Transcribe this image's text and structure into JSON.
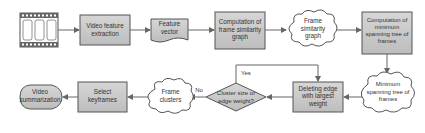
{
  "diagram": {
    "type": "flowchart",
    "colors": {
      "box_fill": "#c9c9c9",
      "box_stroke": "#555555",
      "line": "#666666",
      "cloud_fill": "#ffffff",
      "text": "#333333"
    },
    "nodes": {
      "video_input": {
        "shape": "film-strip",
        "label": ""
      },
      "feature_extraction": {
        "shape": "process",
        "line1": "Video feature",
        "line2": "extraction"
      },
      "feature_vector": {
        "shape": "document",
        "line1": "Feature",
        "line2": "vector"
      },
      "similarity_graph_comp": {
        "shape": "process",
        "line1": "Computation of",
        "line2": "frame similarity",
        "line3": "graph"
      },
      "similarity_graph": {
        "shape": "cloud",
        "line1": "Frame",
        "line2": "similarity",
        "line3": "graph"
      },
      "mst_comp": {
        "shape": "process",
        "line1": "Computation of",
        "line2": "minimum",
        "line3": "spanning tree of",
        "line4": "frames"
      },
      "mst": {
        "shape": "cloud",
        "line1": "Minimum",
        "line2": "spanning tree of",
        "line3": "frames"
      },
      "delete_edge": {
        "shape": "process",
        "line1": "Deleting edge",
        "line2": "with largest",
        "line3": "weight"
      },
      "decision": {
        "shape": "diamond",
        "line1": "Cluster size or",
        "line2": "edge weight?"
      },
      "frame_clusters": {
        "shape": "cloud",
        "line1": "Frame",
        "line2": "clusters"
      },
      "select_keyframes": {
        "shape": "process",
        "line1": "Select",
        "line2": "keyframes"
      },
      "video_summarization": {
        "shape": "terminator",
        "line1": "Video",
        "line2": "summarization"
      }
    },
    "edges": {
      "yes_label": "Yes",
      "no_label": "No"
    }
  }
}
